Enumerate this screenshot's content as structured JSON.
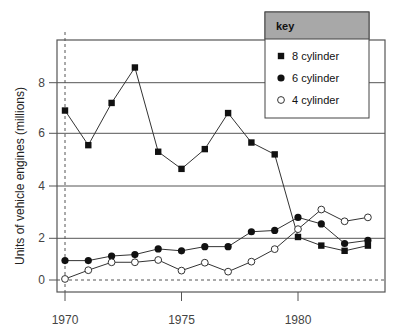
{
  "chart_data": {
    "type": "line",
    "title": "",
    "xlabel": "",
    "ylabel": "Units of vehicle engines (millions)",
    "x": [
      1970,
      1971,
      1972,
      1973,
      1974,
      1975,
      1976,
      1977,
      1978,
      1979,
      1980,
      1981,
      1982,
      1983
    ],
    "x_ticks": [
      "1970",
      "1975",
      "1980"
    ],
    "y_ticks": [
      "0",
      "2",
      "4",
      "6",
      "8"
    ],
    "ylim": [
      -0.5,
      9.5
    ],
    "grid": "horizontal lines at 2, 4, 6, 8; dashed line at 0 and at x=1970",
    "legend": {
      "title": "key",
      "position": "top-right",
      "entries": [
        {
          "label": "8 cylinder",
          "marker": "filled-square"
        },
        {
          "label": "6 cylinder",
          "marker": "filled-circle"
        },
        {
          "label": "4 cylinder",
          "marker": "open-circle"
        }
      ]
    },
    "series": [
      {
        "name": "8 cylinder",
        "marker": "filled-square",
        "values": [
          6.9,
          5.55,
          7.2,
          8.6,
          5.3,
          4.65,
          5.4,
          6.8,
          5.65,
          5.2,
          2.05,
          1.65,
          1.4,
          1.65
        ]
      },
      {
        "name": "6 cylinder",
        "marker": "filled-circle",
        "values": [
          0.93,
          0.93,
          1.15,
          1.22,
          1.49,
          1.4,
          1.6,
          1.6,
          2.25,
          2.3,
          2.8,
          2.55,
          1.75,
          1.9
        ]
      },
      {
        "name": "4 cylinder",
        "marker": "open-circle",
        "values": [
          0.05,
          0.47,
          0.85,
          0.85,
          0.96,
          0.45,
          0.83,
          0.4,
          0.88,
          1.48,
          2.35,
          3.1,
          2.65,
          2.8
        ]
      }
    ],
    "colors": {
      "line": "#333333",
      "grid": "#555555",
      "legend_header": "#a8a8a8"
    }
  }
}
